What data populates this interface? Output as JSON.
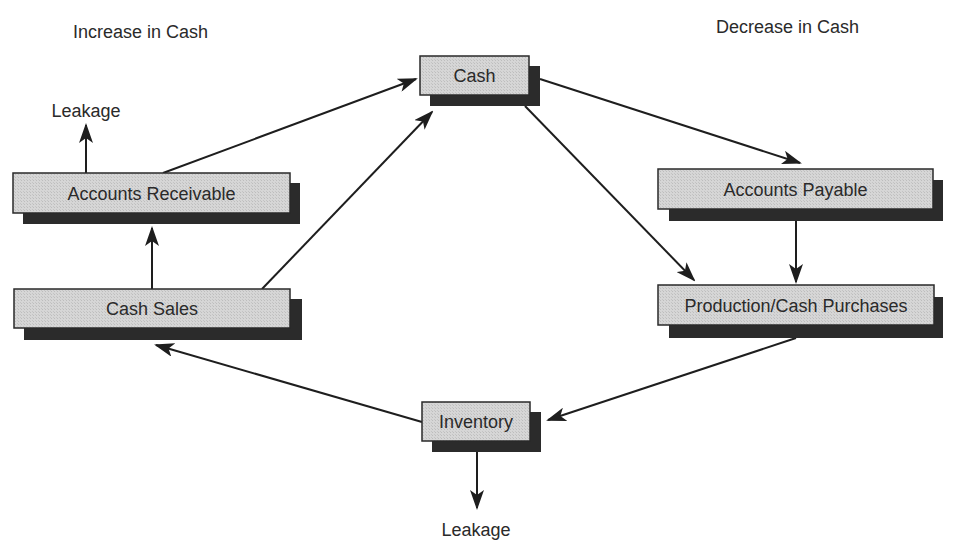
{
  "headers": {
    "left": "Increase in Cash",
    "right": "Decrease in Cash"
  },
  "nodes": {
    "cash": {
      "label": "Cash"
    },
    "accounts_receivable": {
      "label": "Accounts Receivable"
    },
    "cash_sales": {
      "label": "Cash Sales"
    },
    "accounts_payable": {
      "label": "Accounts Payable"
    },
    "production_purchases": {
      "label": "Production/Cash Purchases"
    },
    "inventory": {
      "label": "Inventory"
    }
  },
  "leakage": {
    "top": "Leakage",
    "bottom": "Leakage"
  },
  "edges": [
    {
      "from": "Accounts Receivable",
      "to": "Cash"
    },
    {
      "from": "Cash Sales",
      "to": "Cash"
    },
    {
      "from": "Cash",
      "to": "Accounts Payable"
    },
    {
      "from": "Cash",
      "to": "Production/Cash Purchases"
    },
    {
      "from": "Accounts Payable",
      "to": "Production/Cash Purchases"
    },
    {
      "from": "Production/Cash Purchases",
      "to": "Inventory"
    },
    {
      "from": "Inventory",
      "to": "Cash Sales"
    },
    {
      "from": "Cash Sales",
      "to": "Accounts Receivable"
    },
    {
      "from": "Accounts Receivable",
      "to": "Leakage"
    },
    {
      "from": "Inventory",
      "to": "Leakage"
    }
  ],
  "colors": {
    "box_fill": "#d4d4d4",
    "box_border": "#2a2a2a",
    "shadow": "#2b2b2b",
    "text": "#2a2a2a",
    "background": "#ffffff"
  }
}
